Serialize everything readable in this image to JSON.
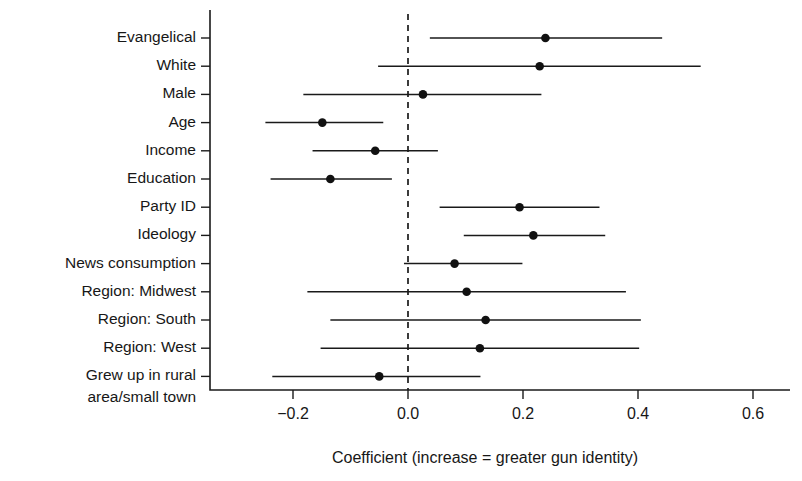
{
  "chart_data": {
    "type": "scatter",
    "subtype": "coefficient-plot-with-error-bars",
    "title": "",
    "xlabel": "Coefficient (increase = greater gun identity)",
    "ylabel": "",
    "xlim": [
      -0.29,
      0.65
    ],
    "xticks": [
      -0.2,
      0.0,
      0.2,
      0.4,
      0.6
    ],
    "xticklabels": [
      "−0.2",
      "0.0",
      "0.2",
      "0.4",
      "0.6"
    ],
    "grid": false,
    "legend": null,
    "reference_line": {
      "value": 0.0,
      "style": "dashed"
    },
    "categories": [
      "Evangelical",
      "White",
      "Male",
      "Age",
      "Income",
      "Education",
      "Party ID",
      "Ideology",
      "News consumption",
      "Region: Midwest",
      "Region: South",
      "Region: West",
      "Grew up in rural area/small town"
    ],
    "points": [
      {
        "label": "Evangelical",
        "estimate": 0.239,
        "ci_low": 0.038,
        "ci_high": 0.442
      },
      {
        "label": "White",
        "estimate": 0.229,
        "ci_low": -0.052,
        "ci_high": 0.509
      },
      {
        "label": "Male",
        "estimate": 0.026,
        "ci_low": -0.182,
        "ci_high": 0.232
      },
      {
        "label": "Age",
        "estimate": -0.149,
        "ci_low": -0.248,
        "ci_high": -0.043
      },
      {
        "label": "Income",
        "estimate": -0.057,
        "ci_low": -0.166,
        "ci_high": 0.052
      },
      {
        "label": "Education",
        "estimate": -0.135,
        "ci_low": -0.239,
        "ci_high": -0.028
      },
      {
        "label": "Party ID",
        "estimate": 0.194,
        "ci_low": 0.055,
        "ci_high": 0.333
      },
      {
        "label": "Ideology",
        "estimate": 0.218,
        "ci_low": 0.097,
        "ci_high": 0.343
      },
      {
        "label": "News consumption",
        "estimate": 0.081,
        "ci_low": -0.007,
        "ci_high": 0.199
      },
      {
        "label": "Region: Midwest",
        "estimate": 0.102,
        "ci_low": -0.175,
        "ci_high": 0.379
      },
      {
        "label": "Region: South",
        "estimate": 0.135,
        "ci_low": -0.135,
        "ci_high": 0.405
      },
      {
        "label": "Region: West",
        "estimate": 0.125,
        "ci_low": -0.152,
        "ci_high": 0.402
      },
      {
        "label": "Grew up in rural area/small town",
        "estimate": -0.05,
        "ci_low": -0.236,
        "ci_high": 0.126
      }
    ]
  },
  "labels": {
    "rows": [
      {
        "lines": [
          "Evangelical"
        ]
      },
      {
        "lines": [
          "White"
        ]
      },
      {
        "lines": [
          "Male"
        ]
      },
      {
        "lines": [
          "Age"
        ]
      },
      {
        "lines": [
          "Income"
        ]
      },
      {
        "lines": [
          "Education"
        ]
      },
      {
        "lines": [
          "Party ID"
        ]
      },
      {
        "lines": [
          "Ideology"
        ]
      },
      {
        "lines": [
          "News consumption"
        ]
      },
      {
        "lines": [
          "Region: Midwest"
        ]
      },
      {
        "lines": [
          "Region: South"
        ]
      },
      {
        "lines": [
          "Region: West"
        ]
      },
      {
        "lines": [
          "Grew up in rural",
          "area/small town"
        ]
      }
    ]
  },
  "colors": {
    "line": "#1a1a1a",
    "point": "#111111",
    "text": "#171717",
    "background": "#ffffff"
  }
}
